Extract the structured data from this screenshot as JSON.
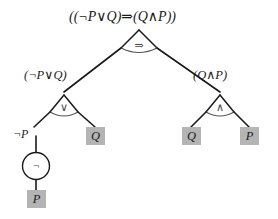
{
  "diagram": {
    "title": "((¬P∨Q)⇒(Q∧P))",
    "type": "logic-parse-tree",
    "background_color": "#ffffff",
    "line_color": "#1a1a1a",
    "leaf_fill_color": "#b4b4b4",
    "glyph_color": "#444444",
    "root": {
      "formula": "((¬P∨Q)⇒(Q∧P))",
      "connective": "⇒",
      "connective_name": "implies"
    },
    "left_subtree": {
      "formula": "(¬P∨Q)",
      "connective": "∨",
      "connective_name": "or",
      "left_child": {
        "formula": "¬P",
        "connective": "¬",
        "connective_name": "not",
        "child_leaf": "P"
      },
      "right_leaf": "Q"
    },
    "right_subtree": {
      "formula": "(Q∧P)",
      "connective": "∧",
      "connective_name": "and",
      "left_leaf": "Q",
      "right_leaf": "P"
    },
    "leaves": [
      {
        "label": "Q",
        "id": "leaf-q-left"
      },
      {
        "label": "P",
        "id": "leaf-p-bottom"
      },
      {
        "label": "Q",
        "id": "leaf-q-right"
      },
      {
        "label": "P",
        "id": "leaf-p-right"
      }
    ]
  }
}
